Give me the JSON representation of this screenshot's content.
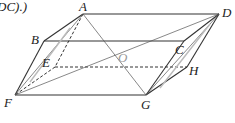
{
  "caption_fragment": "DC).)",
  "labels": {
    "A": "A",
    "B": "B",
    "C": "C",
    "D": "D",
    "E": "E",
    "F": "F",
    "G": "G",
    "H": "H",
    "O": "O"
  },
  "colors": {
    "line": "#333333",
    "thin": "#555555",
    "faint": "#bbbbbb"
  }
}
